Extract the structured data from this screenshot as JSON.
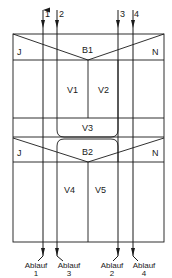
{
  "diagram": {
    "inlets": [
      {
        "label": "1",
        "x": 43
      },
      {
        "label": "2",
        "x": 57
      },
      {
        "label": "3",
        "x": 118
      },
      {
        "label": "4",
        "x": 133
      }
    ],
    "top_section": {
      "left_label": "J",
      "center_label": "B1",
      "right_label": "N",
      "chambers": [
        "V1",
        "V2"
      ]
    },
    "middle_section": {
      "label": "V3"
    },
    "bottom_section": {
      "left_label": "J",
      "center_label": "B2",
      "right_label": "N",
      "chambers": [
        "V4",
        "V5"
      ]
    },
    "outlets": [
      {
        "word": "Ablauf",
        "num": "1",
        "x": 43
      },
      {
        "word": "Ablauf",
        "num": "3",
        "x": 57
      },
      {
        "word": "Ablauf",
        "num": "2",
        "x": 118
      },
      {
        "word": "Ablauf",
        "num": "4",
        "x": 133
      }
    ],
    "colors": {
      "line": "#1a1a1a",
      "background": "#ffffff"
    }
  }
}
